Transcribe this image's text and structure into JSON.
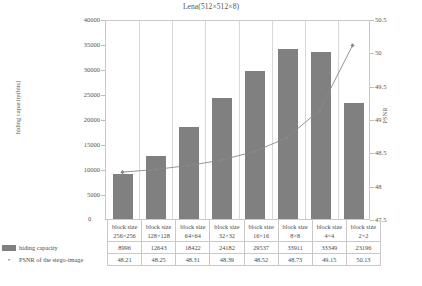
{
  "chart_data": {
    "type": "bar",
    "title": "Lena(512×512×8)",
    "xlabel": "",
    "ylabel": "hiding capacity(bits)",
    "y2label": "PSNR",
    "categories": [
      "block size 256×256",
      "block size 128×128",
      "block size 64×64",
      "block size 32×32",
      "block size 16×16",
      "block size 8×8",
      "block size 4×4",
      "block size 2×2"
    ],
    "series": [
      {
        "name": "hiding capacity",
        "type": "bar",
        "axis": "left",
        "values": [
          8996,
          12643,
          18422,
          24182,
          29537,
          33911,
          33349,
          23196
        ],
        "color": "#808080"
      },
      {
        "name": "PSNR of the stego-image",
        "type": "line",
        "axis": "right",
        "values": [
          48.21,
          48.25,
          48.31,
          48.39,
          48.52,
          48.73,
          49.15,
          50.13
        ],
        "color": "#888888"
      }
    ],
    "ylim": [
      0,
      40000
    ],
    "ylim_right": [
      47.5,
      50.5
    ],
    "yticks": [
      0,
      5000,
      10000,
      15000,
      20000,
      25000,
      30000,
      35000,
      40000
    ],
    "yticks_right": [
      47.5,
      48,
      48.5,
      49,
      49.5,
      50,
      50.5
    ],
    "grid": true,
    "legend_position": "bottom-table"
  },
  "axes": {
    "left_ticks": [
      "40000",
      "35000",
      "30000",
      "25000",
      "20000",
      "15000",
      "10000",
      "5000"
    ],
    "zero_tick": "0",
    "right_ticks": [
      "50.5",
      "50",
      "49.5",
      "49",
      "48.5",
      "48",
      "47.5"
    ],
    "left_title": "hiding capacity(bits)",
    "right_title": "PSNR"
  },
  "table": {
    "block_size_prefix": "block size",
    "headers": [
      {
        "line1": "block size",
        "line2": "256×256"
      },
      {
        "line1": "block size",
        "line2": "128×128"
      },
      {
        "line1": "block size",
        "line2": "64×64"
      },
      {
        "line1": "block size",
        "line2": "32×32"
      },
      {
        "line1": "block size",
        "line2": "16×16"
      },
      {
        "line1": "block size",
        "line2": "8×8"
      },
      {
        "line1": "block size",
        "line2": "4×4"
      },
      {
        "line1": "block size",
        "line2": "2×2"
      }
    ],
    "rows": [
      {
        "legend": "hiding capacity",
        "marker": "bar",
        "values": [
          "8996",
          "12643",
          "18422",
          "24182",
          "29537",
          "33911",
          "33349",
          "23196"
        ]
      },
      {
        "legend": "PSNR of the stego-image",
        "marker": "line",
        "marker_glyph": "•",
        "values": [
          "48.21",
          "48.25",
          "48.31",
          "48.39",
          "48.52",
          "48.73",
          "49.15",
          "50.13"
        ]
      }
    ]
  }
}
